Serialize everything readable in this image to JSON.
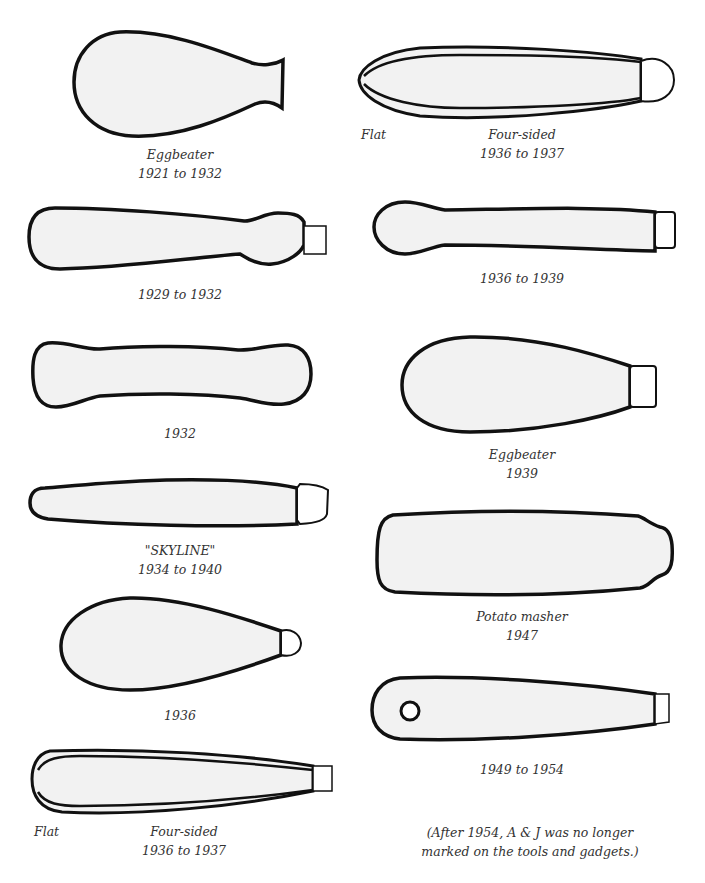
{
  "figure": {
    "left_column": [
      {
        "id": "eggbeater-1921",
        "lines": [
          "Eggbeater",
          "1921 to 1932"
        ]
      },
      {
        "id": "handle-1929",
        "lines": [
          "1929 to 1932"
        ]
      },
      {
        "id": "handle-1932",
        "lines": [
          "1932"
        ]
      },
      {
        "id": "skyline",
        "lines": [
          "\"SKYLINE\"",
          "1934 to 1940"
        ]
      },
      {
        "id": "handle-1936",
        "lines": [
          "1936"
        ]
      },
      {
        "id": "four-sided-left",
        "flat_label": "Flat",
        "lines": [
          "Four-sided",
          "1936 to 1937"
        ]
      }
    ],
    "right_column": [
      {
        "id": "four-sided-right",
        "flat_label": "Flat",
        "lines": [
          "Four-sided",
          "1936 to 1937"
        ]
      },
      {
        "id": "handle-1936-1939",
        "lines": [
          "1936 to 1939"
        ]
      },
      {
        "id": "eggbeater-1939",
        "lines": [
          "Eggbeater",
          "1939"
        ]
      },
      {
        "id": "potato-masher",
        "lines": [
          "Potato masher",
          "1947"
        ]
      },
      {
        "id": "handle-1949",
        "lines": [
          "1949 to 1954"
        ]
      }
    ],
    "footnote": [
      "(After 1954, A & J was no longer",
      "marked on the tools and gadgets.)"
    ]
  },
  "colors": {
    "outline": "#111111",
    "fill": "#f2f2f2",
    "text": "#333333",
    "background": "#ffffff"
  }
}
